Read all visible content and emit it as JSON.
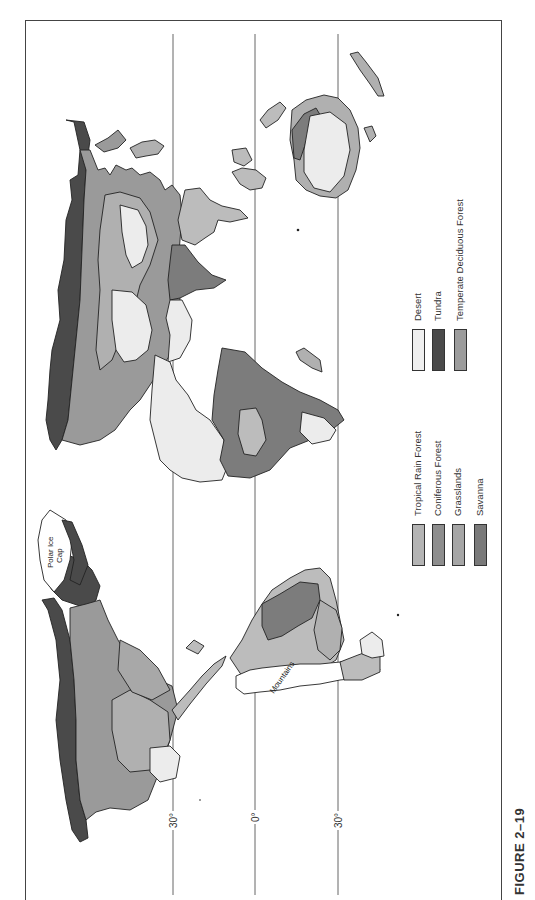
{
  "figure": {
    "label": "FIGURE 2–19",
    "orientation": "rotated 90° counter-clockwise"
  },
  "map": {
    "title": "World biomes",
    "latitude_lines": [
      {
        "label": "30°",
        "value": "30N"
      },
      {
        "label": "0°",
        "value": "Equator"
      },
      {
        "label": "30°",
        "value": "30S"
      }
    ],
    "annotations": {
      "polar_ice_cap_line1": "Polar Ice",
      "polar_ice_cap_line2": "Cap",
      "mountains": "Mountains"
    }
  },
  "legend": {
    "items": [
      {
        "label": "Tropical Rain Forest",
        "color": "#b4b4b4"
      },
      {
        "label": "Coniferous Forest",
        "color": "#8e8e8e"
      },
      {
        "label": "Grasslands",
        "color": "#a6a6a6"
      },
      {
        "label": "Savanna",
        "color": "#7a7a7a"
      },
      {
        "label": "Desert",
        "color": "#efefef"
      },
      {
        "label": "Tundra",
        "color": "#4a4a4a"
      },
      {
        "label": "Temperate Deciduous Forest",
        "color": "#9c9c9c"
      }
    ]
  },
  "colors": {
    "frame": "#444444",
    "outline": "#222222",
    "tundra": "#4a4a4a",
    "coniferous": "#9a9a9a",
    "temperate": "#a8a8a8",
    "grassland": "#b0b0b0",
    "savanna": "#7c7c7c",
    "rainforest": "#bcbcbc",
    "desert": "#ececec"
  }
}
